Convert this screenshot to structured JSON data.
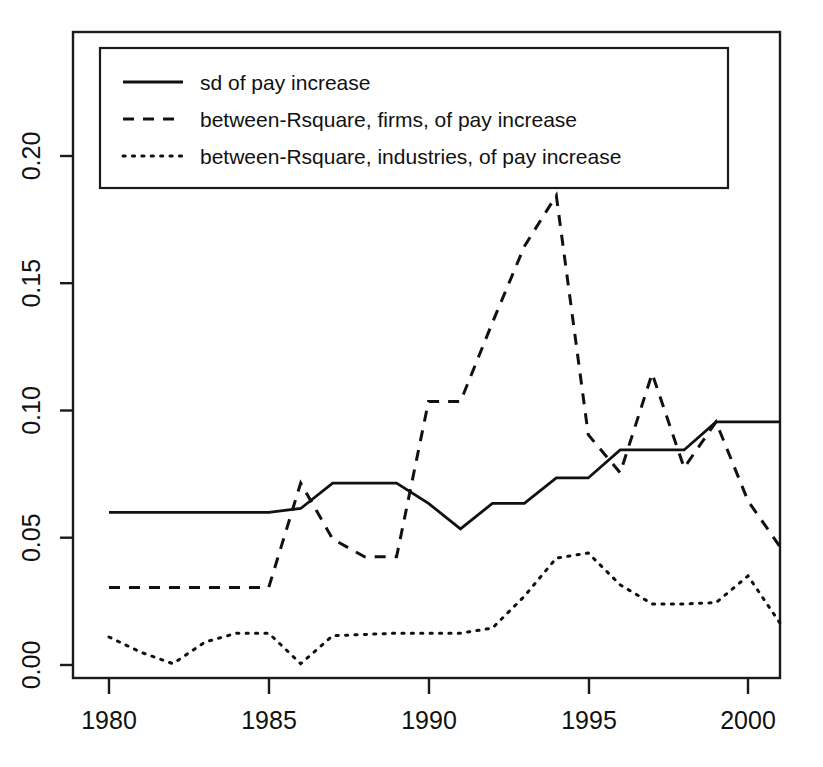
{
  "chart_data": {
    "type": "line",
    "title": "",
    "subtitle": "",
    "xlabel": "",
    "ylabel": "",
    "xlim": [
      1980,
      2001
    ],
    "ylim": [
      0.0,
      0.215
    ],
    "grid": false,
    "legend_position": "top-left",
    "x": [
      1980,
      1981,
      1982,
      1983,
      1984,
      1985,
      1986,
      1987,
      1988,
      1989,
      1990,
      1991,
      1992,
      1993,
      1994,
      1995,
      1996,
      1997,
      1998,
      1999,
      2000,
      2001
    ],
    "xticks": [
      1980,
      1985,
      1990,
      1995,
      2000
    ],
    "xtick_labels": [
      "1980",
      "1985",
      "1990",
      "1995",
      "2000"
    ],
    "yticks": [
      0.0,
      0.05,
      0.1,
      0.15,
      0.2
    ],
    "ytick_labels": [
      "0.00",
      "0.05",
      "0.10",
      "0.15",
      "0.20"
    ],
    "series": [
      {
        "name": "sd of pay increase",
        "style": "solid",
        "values": [
          0.06,
          0.06,
          0.06,
          0.06,
          0.06,
          0.06,
          0.0615,
          0.0715,
          0.0715,
          0.0715,
          0.0635,
          0.0535,
          0.0635,
          0.0635,
          0.0735,
          0.0735,
          0.0845,
          0.0845,
          0.0845,
          0.0955,
          0.0955,
          0.0955
        ]
      },
      {
        "name": "between-Rsquare, firms, of pay increase",
        "style": "dashed",
        "values": [
          0.0305,
          0.0305,
          0.0305,
          0.0305,
          0.0305,
          0.0305,
          0.0715,
          0.0495,
          0.0425,
          0.0425,
          0.1035,
          0.1035,
          0.1345,
          0.1645,
          0.1845,
          0.0905,
          0.0755,
          0.1145,
          0.0775,
          0.0955,
          0.0645,
          0.0465
        ]
      },
      {
        "name": "between-Rsquare, industries, of pay increase",
        "style": "dotted",
        "values": [
          0.011,
          0.005,
          0.0005,
          0.009,
          0.0125,
          0.0125,
          0.0005,
          0.0115,
          0.012,
          0.0125,
          0.0125,
          0.0125,
          0.0145,
          0.027,
          0.042,
          0.044,
          0.0315,
          0.024,
          0.024,
          0.0245,
          0.035,
          0.0165
        ]
      }
    ]
  },
  "legend": {
    "entries": [
      {
        "label": "sd of pay increase",
        "style": "solid"
      },
      {
        "label": "between-Rsquare, firms, of pay increase",
        "style": "dashed"
      },
      {
        "label": "between-Rsquare, industries, of pay increase",
        "style": "dotted"
      }
    ]
  },
  "axes": {
    "y_labels": [
      "0.00",
      "0.05",
      "0.10",
      "0.15",
      "0.20"
    ],
    "x_labels": [
      "1980",
      "1985",
      "1990",
      "1995",
      "2000"
    ]
  }
}
